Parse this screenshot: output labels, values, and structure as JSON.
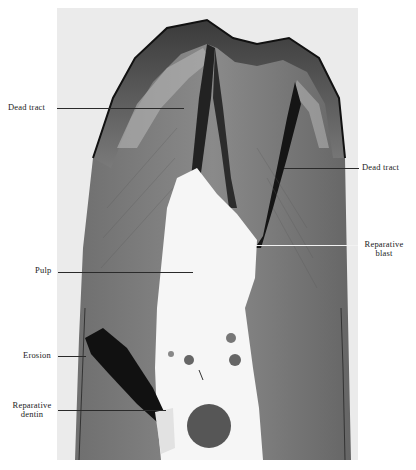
{
  "figure": {
    "labels": {
      "dead_tract_left": "Dead tract",
      "dead_tract_right": "Dead tract",
      "reparative_blast_line1": "Reparative",
      "reparative_blast_line2": "blast",
      "pulp": "Pulp",
      "erosion": "Erosion",
      "reparative_dentin_line1": "Reparative",
      "reparative_dentin_line2": "dentin"
    },
    "caption_fragment": ""
  }
}
